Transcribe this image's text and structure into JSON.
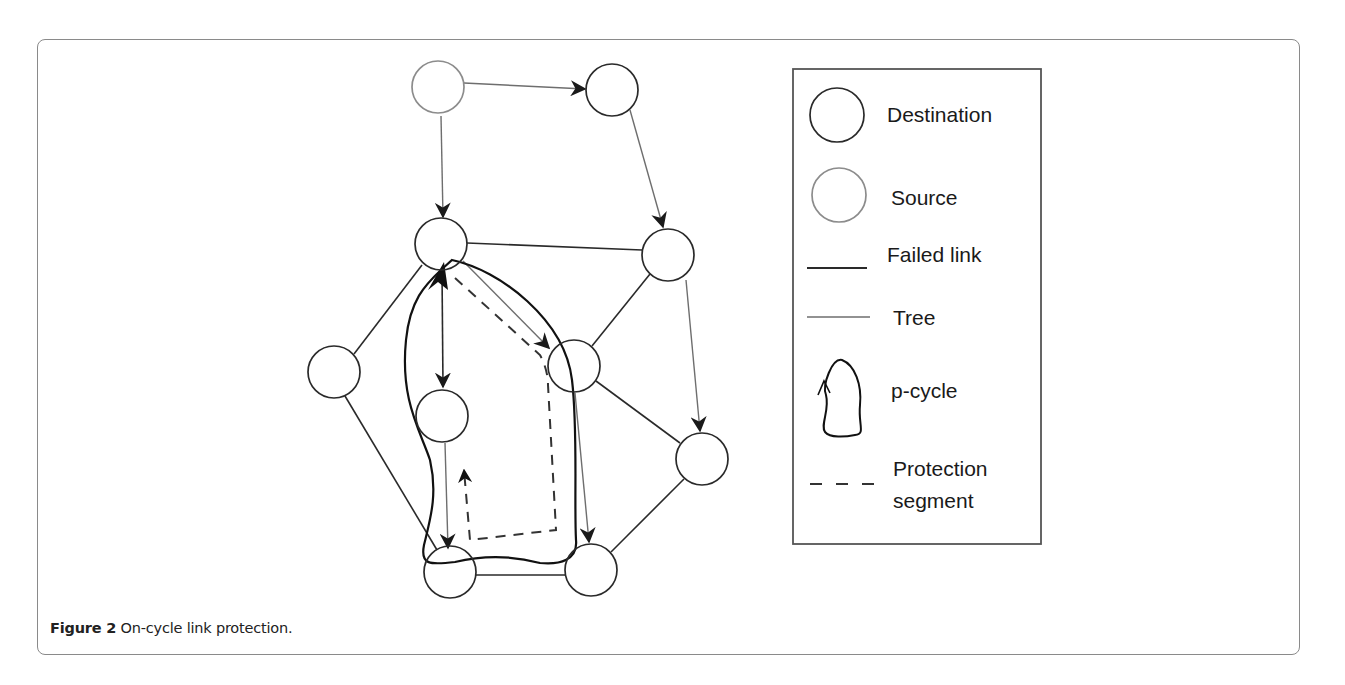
{
  "figure": {
    "caption_label": "Figure 2",
    "caption_text": "On-cycle link protection."
  },
  "legend": {
    "items": [
      {
        "label": "Destination",
        "symbol": "circle-dark"
      },
      {
        "label": "Source",
        "symbol": "circle-gray"
      },
      {
        "label": "Failed link",
        "symbol": "line-dark"
      },
      {
        "label": "Tree",
        "symbol": "line-gray"
      },
      {
        "label": "p-cycle",
        "symbol": "closed-curve-with-arrow"
      },
      {
        "label": "Protection",
        "label2": "segment",
        "symbol": "dashed-line"
      }
    ]
  },
  "graph": {
    "nodes": [
      {
        "id": "n1",
        "x": 438,
        "y": 87,
        "role": "source"
      },
      {
        "id": "n2",
        "x": 612,
        "y": 90,
        "role": "destination"
      },
      {
        "id": "n3",
        "x": 441,
        "y": 244,
        "role": "destination"
      },
      {
        "id": "n4",
        "x": 668,
        "y": 255,
        "role": "destination"
      },
      {
        "id": "n5",
        "x": 334,
        "y": 372,
        "role": "destination"
      },
      {
        "id": "n6",
        "x": 442,
        "y": 416,
        "role": "destination"
      },
      {
        "id": "n7",
        "x": 574,
        "y": 366,
        "role": "destination"
      },
      {
        "id": "n8",
        "x": 702,
        "y": 459,
        "role": "destination"
      },
      {
        "id": "n9",
        "x": 450,
        "y": 572,
        "role": "destination"
      },
      {
        "id": "n10",
        "x": 591,
        "y": 570,
        "role": "destination"
      }
    ],
    "tree_edges": [
      {
        "from": "n1",
        "to": "n2"
      },
      {
        "from": "n1",
        "to": "n3"
      },
      {
        "from": "n2",
        "to": "n4"
      },
      {
        "from": "n4",
        "to": "n8"
      },
      {
        "from": "n3",
        "to": "n7"
      },
      {
        "from": "n6",
        "to": "n9"
      },
      {
        "from": "n7",
        "to": "n10"
      }
    ],
    "plain_edges": [
      {
        "from": "n3",
        "to": "n4"
      },
      {
        "from": "n3",
        "to": "n5"
      },
      {
        "from": "n5",
        "to": "n9"
      },
      {
        "from": "n4",
        "to": "n7"
      },
      {
        "from": "n7",
        "to": "n8"
      },
      {
        "from": "n8",
        "to": "n10"
      },
      {
        "from": "n9",
        "to": "n10"
      }
    ],
    "failed_link": {
      "from": "n3",
      "to": "n6"
    },
    "colors": {
      "destination_stroke": "#2a2a2a",
      "source_stroke": "#8c8c8c",
      "tree_stroke": "#6e6e6e",
      "link_stroke": "#2a2a2a",
      "pcycle_stroke": "#111111"
    }
  }
}
